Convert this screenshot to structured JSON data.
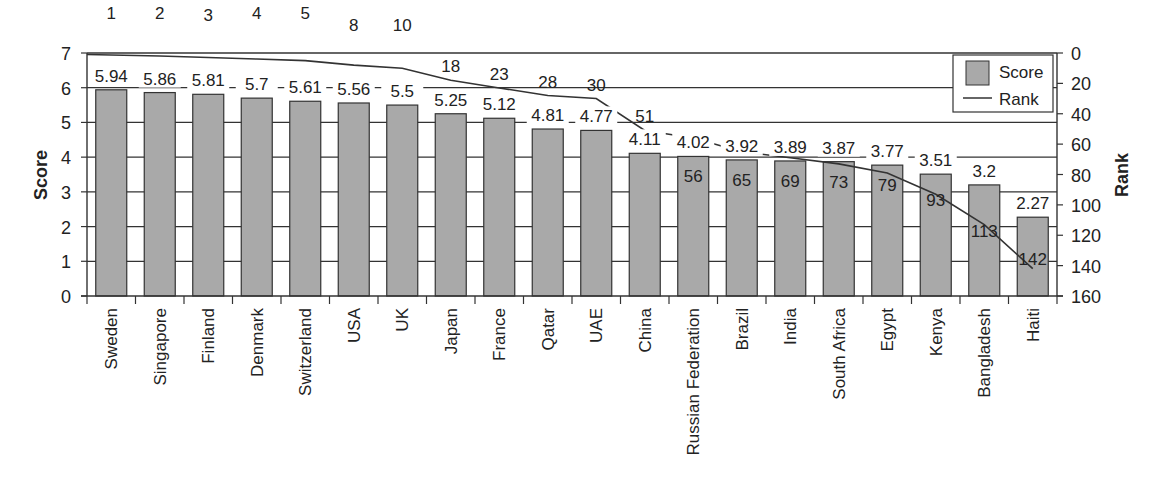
{
  "chart_data": {
    "type": "bar",
    "title": "",
    "categories": [
      "Sweden",
      "Singapore",
      "Finland",
      "Denmark",
      "Switzerland",
      "USA",
      "UK",
      "Japan",
      "France",
      "Qatar",
      "UAE",
      "China",
      "Russian Federation",
      "Brazil",
      "India",
      "South Africa",
      "Egypt",
      "Kenya",
      "Bangladesh",
      "Haiti"
    ],
    "series": [
      {
        "name": "Score",
        "type": "bar",
        "axis": "left",
        "values": [
          5.94,
          5.86,
          5.81,
          5.7,
          5.61,
          5.56,
          5.5,
          5.25,
          5.12,
          4.81,
          4.77,
          4.11,
          4.02,
          3.92,
          3.89,
          3.87,
          3.77,
          3.51,
          3.2,
          2.27
        ],
        "labels": [
          "5.94",
          "5.86",
          "5.81",
          "5.7",
          "5.61",
          "5.56",
          "5.5",
          "5.25",
          "5.12",
          "4.81",
          "4.77",
          "4.11",
          "4.02",
          "3.92",
          "3.89",
          "3.87",
          "3.77",
          "3.51",
          "3.2",
          "2.27"
        ]
      },
      {
        "name": "Rank",
        "type": "line",
        "axis": "right",
        "values": [
          1,
          2,
          3,
          4,
          5,
          8,
          10,
          18,
          23,
          28,
          30,
          51,
          56,
          65,
          69,
          73,
          79,
          93,
          113,
          142
        ],
        "labels": [
          "1",
          "2",
          "3",
          "4",
          "5",
          "8",
          "10",
          "18",
          "23",
          "28",
          "30",
          "51",
          "56",
          "65",
          "69",
          "73",
          "79",
          "93",
          "113",
          "142"
        ]
      }
    ],
    "xlabel": "",
    "ylabel": "Score",
    "y2label": "Rank",
    "ylim": [
      0,
      7
    ],
    "y2lim": [
      0,
      160
    ],
    "y2_inverted": true,
    "yticks": [
      "0",
      "1",
      "2",
      "3",
      "4",
      "5",
      "6",
      "7"
    ],
    "y2ticks": [
      "0",
      "20",
      "40",
      "60",
      "80",
      "100",
      "120",
      "140",
      "160"
    ],
    "grid": true,
    "legend": {
      "position": "top-right",
      "entries": [
        "Score",
        "Rank"
      ]
    },
    "colors": {
      "bar": "#a9a9a9",
      "line": "#333333",
      "grid": "#333333"
    }
  }
}
